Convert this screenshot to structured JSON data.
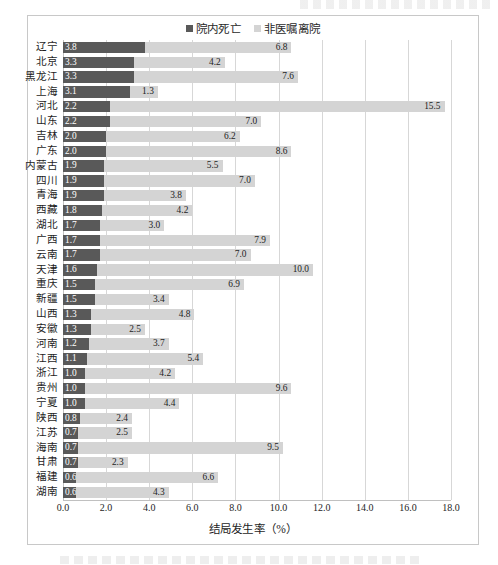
{
  "figure": {
    "frame_border_color": "#c8c8c8",
    "background": "#ffffff"
  },
  "legend": {
    "position": "top-center",
    "items": [
      {
        "label": "院内死亡",
        "color": "#595959",
        "marker": "square"
      },
      {
        "label": "非医嘱离院",
        "color": "#d4d4d4",
        "marker": "square"
      }
    ]
  },
  "chart_data": {
    "type": "bar",
    "orientation": "horizontal",
    "stacked": true,
    "title": "",
    "xlabel": "结局发生率（%）",
    "ylabel": "",
    "xlim": [
      0.0,
      18.0
    ],
    "xticks": [
      "0.0",
      "2.0",
      "4.0",
      "6.0",
      "8.0",
      "10.0",
      "12.0",
      "14.0",
      "16.0",
      "18.0"
    ],
    "xtick_values": [
      0,
      2,
      4,
      6,
      8,
      10,
      12,
      14,
      16,
      18
    ],
    "grid": "vertical",
    "categories": [
      "辽宁",
      "北京",
      "黑龙江",
      "上海",
      "河北",
      "山东",
      "吉林",
      "广东",
      "内蒙古",
      "四川",
      "青海",
      "西藏",
      "湖北",
      "广西",
      "云南",
      "天津",
      "重庆",
      "新疆",
      "山西",
      "安徽",
      "河南",
      "江西",
      "浙江",
      "贵州",
      "宁夏",
      "陕西",
      "江苏",
      "海南",
      "甘肃",
      "福建",
      "湖南"
    ],
    "series": [
      {
        "name": "院内死亡",
        "color": "#595959",
        "values": [
          3.8,
          3.3,
          3.3,
          3.1,
          2.2,
          2.2,
          2.0,
          2.0,
          1.9,
          1.9,
          1.9,
          1.8,
          1.7,
          1.7,
          1.7,
          1.6,
          1.5,
          1.5,
          1.3,
          1.3,
          1.2,
          1.1,
          1.0,
          1.0,
          1.0,
          0.8,
          0.7,
          0.7,
          0.7,
          0.6,
          0.6
        ],
        "labels": [
          "3.8",
          "3.3",
          "3.3",
          "3.1",
          "2.2",
          "2.2",
          "2.0",
          "2.0",
          "1.9",
          "1.9",
          "1.9",
          "1.8",
          "1.7",
          "1.7",
          "1.7",
          "1.6",
          "1.5",
          "1.5",
          "1.3",
          "1.3",
          "1.2",
          "1.1",
          "1.0",
          "1.0",
          "1.0",
          "0.8",
          "0.7",
          "0.7",
          "0.7",
          "0.6",
          "0.6"
        ]
      },
      {
        "name": "非医嘱离院",
        "color": "#d4d4d4",
        "values": [
          6.8,
          4.2,
          7.6,
          1.3,
          15.5,
          7.0,
          6.2,
          8.6,
          5.5,
          7.0,
          3.8,
          4.2,
          3.0,
          7.9,
          7.0,
          10.0,
          6.9,
          3.4,
          4.8,
          2.5,
          3.7,
          5.4,
          4.2,
          9.6,
          4.4,
          2.4,
          2.5,
          9.5,
          2.3,
          6.6,
          4.3
        ],
        "labels": [
          "6.8",
          "4.2",
          "7.6",
          "1.3",
          "15.5",
          "7.0",
          "6.2",
          "8.6",
          "5.5",
          "7.0",
          "3.8",
          "4.2",
          "3.0",
          "7.9",
          "7.0",
          "10.0",
          "6.9",
          "3.4",
          "4.8",
          "2.5",
          "3.7",
          "5.4",
          "4.2",
          "9.6",
          "4.4",
          "2.4",
          "2.5",
          "9.5",
          "2.3",
          "6.6",
          "4.3"
        ]
      }
    ]
  }
}
